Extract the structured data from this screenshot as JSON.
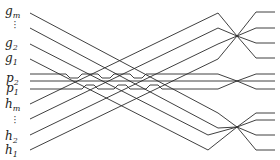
{
  "diagram": {
    "type": "wire-crossing network",
    "labels": {
      "g_m": {
        "base": "g",
        "sub": "m"
      },
      "g_2": {
        "base": "g",
        "sub": "2"
      },
      "g_1": {
        "base": "g",
        "sub": "1"
      },
      "p_2": {
        "base": "p",
        "sub": "2"
      },
      "p_1": {
        "base": "p",
        "sub": "1"
      },
      "h_m": {
        "base": "h",
        "sub": "m"
      },
      "h_2": {
        "base": "h",
        "sub": "2"
      },
      "h_1": {
        "base": "h",
        "sub": "1"
      },
      "vdots": "·\n·\n·"
    },
    "left_endpoints_y": [
      13,
      28,
      44,
      59,
      74,
      81,
      89,
      104,
      119,
      135,
      150
    ],
    "right_endpoints_y": [
      12,
      28,
      43,
      58,
      74,
      81,
      89,
      104,
      119,
      135,
      150
    ],
    "crossing_points": [
      {
        "name": "upper-right-crossing",
        "x": 237,
        "y": 36
      },
      {
        "name": "middle-right-crossing",
        "x": 237,
        "y": 81
      },
      {
        "name": "lower-right-crossing",
        "x": 237,
        "y": 127
      }
    ],
    "colors": {
      "stroke": "#2a2a2a",
      "background": "#ffffff"
    }
  }
}
